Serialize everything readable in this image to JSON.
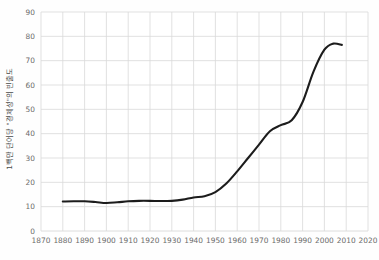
{
  "chart_data": {
    "type": "line",
    "title": "",
    "subtitle": "",
    "xlabel": "",
    "ylabel": "1백만 단어당 \"경제성\"의 빈출도",
    "xlim": [
      1870,
      2020
    ],
    "ylim": [
      0,
      90
    ],
    "xticks": [
      1870,
      1880,
      1890,
      1900,
      1910,
      1920,
      1930,
      1940,
      1950,
      1960,
      1970,
      1980,
      1990,
      2000,
      2010,
      2020
    ],
    "yticks": [
      0,
      10,
      20,
      30,
      40,
      50,
      60,
      70,
      80,
      90
    ],
    "xtick_labels": [
      "1870",
      "1880",
      "1890",
      "1900",
      "1910",
      "1920",
      "1930",
      "1940",
      "1950",
      "1960",
      "1970",
      "1980",
      "1990",
      "2000",
      "2010",
      "2020"
    ],
    "ytick_labels": [
      "0",
      "10",
      "20",
      "30",
      "40",
      "50",
      "60",
      "70",
      "80",
      "90"
    ],
    "grid": true,
    "grid_color": "#d9d9d9",
    "legend": false,
    "legend_position": "none",
    "line_color": "#1c1c1c",
    "line_width": 2.1,
    "background_color": "#fefefe",
    "x": [
      1880,
      1885,
      1890,
      1895,
      1900,
      1905,
      1910,
      1915,
      1920,
      1925,
      1930,
      1935,
      1940,
      1945,
      1950,
      1955,
      1960,
      1965,
      1970,
      1975,
      1980,
      1985,
      1990,
      1995,
      2000,
      2004,
      2008
    ],
    "values": [
      12.1,
      12.2,
      12.2,
      11.9,
      11.5,
      11.8,
      12.2,
      12.4,
      12.4,
      12.3,
      12.4,
      12.9,
      13.8,
      14.3,
      16.0,
      19.5,
      24.5,
      30.0,
      35.5,
      41.0,
      43.5,
      45.5,
      53.0,
      65.5,
      74.5,
      77.0,
      76.5
    ]
  },
  "axis": {
    "y_title": "1백만 단어당 \"경제성\"의 빈출도"
  }
}
